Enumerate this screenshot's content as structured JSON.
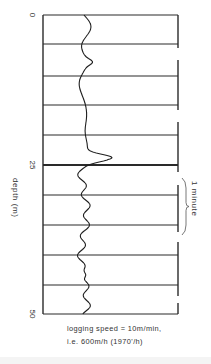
{
  "figure": {
    "type": "well-log-trace",
    "axis": {
      "label": "depth (m)",
      "ticks": [
        {
          "label": "0",
          "y": 15
        },
        {
          "label": "25",
          "y": 165
        },
        {
          "label": "50",
          "y": 314
        }
      ],
      "range_m": [
        0,
        50
      ]
    },
    "grid": {
      "left_x": 43,
      "right_x": 178,
      "line_ys": [
        15,
        44,
        76,
        105,
        135,
        165,
        195,
        225,
        255,
        285,
        314
      ],
      "emphasis_y": 165
    },
    "minute_marks": {
      "segments": [
        [
          15,
          48
        ],
        [
          60,
          110
        ],
        [
          122,
          172
        ],
        [
          185,
          232
        ],
        [
          242,
          296
        ],
        [
          303,
          314
        ]
      ],
      "brace_label": "1 minute",
      "brace_span": [
        178,
        235
      ]
    },
    "caption": {
      "line1": "logging speed = 10m/min,",
      "line2": "i.e. 600m/h (1970'/h)"
    },
    "colors": {
      "ink": "#2a2a2a",
      "background": "#ffffff"
    }
  }
}
